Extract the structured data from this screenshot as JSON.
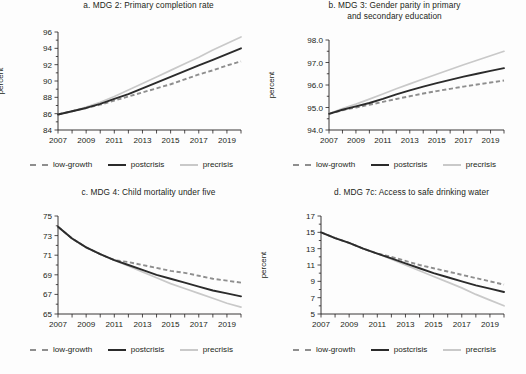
{
  "figure": {
    "background": "#fdfdfd",
    "colors": {
      "precrisis": "#c9c9c9",
      "postcrisis": "#2b2b2b",
      "low_growth": "#8e8e8e",
      "axis": "#231f20"
    },
    "legend": {
      "low_growth_label": "low-growth",
      "postcrisis_label": "postcrisis",
      "precrisis_label": "precrisis"
    }
  },
  "chart_data": [
    {
      "id": "a",
      "type": "line",
      "title": "a.  MDG 2: Primary completion rate",
      "title_line1": "a.  MDG 2: Primary completion rate",
      "title_line2": "",
      "xlabel": "",
      "ylabel": "percent",
      "ylim": [
        84,
        96
      ],
      "yticks": [
        84,
        86,
        88,
        90,
        92,
        94,
        96
      ],
      "ytick_labels": [
        "84",
        "86",
        "88",
        "90",
        "92",
        "94",
        "96"
      ],
      "xlim": [
        2007,
        2020
      ],
      "xticks": [
        2007,
        2008,
        2009,
        2010,
        2011,
        2012,
        2013,
        2014,
        2015,
        2016,
        2017,
        2018,
        2019,
        2020
      ],
      "xtick_labels": [
        "2007",
        "2009",
        "2011",
        "2013",
        "2015",
        "2017",
        "2019"
      ],
      "xtick_labeled_years": [
        2007,
        2009,
        2011,
        2013,
        2015,
        2017,
        2019
      ],
      "grid": false,
      "legend_position": "below",
      "x": [
        2007,
        2008,
        2009,
        2010,
        2011,
        2012,
        2013,
        2014,
        2015,
        2016,
        2017,
        2018,
        2019,
        2020
      ],
      "series": [
        {
          "name": "precrisis",
          "values": [
            85.9,
            86.3,
            86.8,
            87.4,
            88.1,
            88.9,
            89.7,
            90.5,
            91.3,
            92.1,
            92.9,
            93.8,
            94.6,
            95.4
          ]
        },
        {
          "name": "postcrisis",
          "values": [
            85.9,
            86.3,
            86.7,
            87.2,
            87.8,
            88.4,
            89.1,
            89.8,
            90.5,
            91.2,
            91.9,
            92.6,
            93.3,
            94.0
          ]
        },
        {
          "name": "low-growth",
          "values": [
            85.9,
            86.3,
            86.7,
            87.1,
            87.6,
            88.1,
            88.6,
            89.1,
            89.6,
            90.2,
            90.8,
            91.3,
            91.9,
            92.4
          ]
        }
      ]
    },
    {
      "id": "b",
      "type": "line",
      "title": "b.  MDG 3: Gender parity in primary and secondary education",
      "title_line1": "b.  MDG 3: Gender parity in primary",
      "title_line2": "and secondary education",
      "xlabel": "",
      "ylabel": "percent",
      "ylim": [
        94.0,
        98.0
      ],
      "yticks": [
        94.0,
        95.0,
        96.0,
        97.0,
        98.0
      ],
      "ytick_labels": [
        "94.0",
        "95.0",
        "96.0",
        "97.0",
        "98.0"
      ],
      "xlim": [
        2007,
        2020
      ],
      "xticks": [
        2007,
        2008,
        2009,
        2010,
        2011,
        2012,
        2013,
        2014,
        2015,
        2016,
        2017,
        2018,
        2019,
        2020
      ],
      "xtick_labels": [
        "2007",
        "2009",
        "2011",
        "2013",
        "2015",
        "2017",
        "2019"
      ],
      "xtick_labeled_years": [
        2007,
        2009,
        2011,
        2013,
        2015,
        2017,
        2019
      ],
      "grid": false,
      "legend_position": "below",
      "x": [
        2007,
        2008,
        2009,
        2010,
        2011,
        2012,
        2013,
        2014,
        2015,
        2016,
        2017,
        2018,
        2019,
        2020
      ],
      "series": [
        {
          "name": "precrisis",
          "values": [
            94.72,
            94.95,
            95.15,
            95.37,
            95.6,
            95.83,
            96.05,
            96.27,
            96.48,
            96.69,
            96.9,
            97.1,
            97.3,
            97.5
          ]
        },
        {
          "name": "postcrisis",
          "values": [
            94.72,
            94.9,
            95.05,
            95.2,
            95.38,
            95.58,
            95.76,
            95.93,
            96.08,
            96.23,
            96.37,
            96.5,
            96.63,
            96.75
          ]
        },
        {
          "name": "low-growth",
          "values": [
            94.72,
            94.88,
            95.0,
            95.12,
            95.25,
            95.38,
            95.5,
            95.62,
            95.73,
            95.83,
            95.93,
            96.02,
            96.11,
            96.2
          ]
        }
      ]
    },
    {
      "id": "c",
      "type": "line",
      "title": "c.  MDG 4: Child mortality under five",
      "title_line1": "c.  MDG 4: Child mortality under five",
      "title_line2": "",
      "xlabel": "",
      "ylabel": "deaths per 1,000",
      "ylim": [
        65,
        75
      ],
      "yticks": [
        65,
        67,
        69,
        71,
        73,
        75
      ],
      "ytick_labels": [
        "65",
        "67",
        "69",
        "71",
        "73",
        "75"
      ],
      "xlim": [
        2007,
        2020
      ],
      "xticks": [
        2007,
        2008,
        2009,
        2010,
        2011,
        2012,
        2013,
        2014,
        2015,
        2016,
        2017,
        2018,
        2019,
        2020
      ],
      "xtick_labels": [
        "2007",
        "2009",
        "2011",
        "2013",
        "2015",
        "2017",
        "2019"
      ],
      "xtick_labeled_years": [
        2007,
        2009,
        2011,
        2013,
        2015,
        2017,
        2019
      ],
      "grid": false,
      "legend_position": "below",
      "x": [
        2007,
        2008,
        2009,
        2010,
        2011,
        2012,
        2013,
        2014,
        2015,
        2016,
        2017,
        2018,
        2019,
        2020
      ],
      "series": [
        {
          "name": "precrisis",
          "values": [
            73.9,
            72.7,
            71.8,
            71.1,
            70.5,
            69.9,
            69.3,
            68.7,
            68.1,
            67.6,
            67.1,
            66.6,
            66.1,
            65.7
          ]
        },
        {
          "name": "postcrisis",
          "values": [
            73.9,
            72.7,
            71.8,
            71.1,
            70.5,
            70.0,
            69.5,
            69.0,
            68.6,
            68.2,
            67.8,
            67.4,
            67.1,
            66.8
          ]
        },
        {
          "name": "low-growth",
          "values": [
            73.9,
            72.7,
            71.8,
            71.1,
            70.5,
            70.3,
            70.0,
            69.7,
            69.4,
            69.2,
            68.9,
            68.6,
            68.4,
            68.2
          ]
        }
      ]
    },
    {
      "id": "d",
      "type": "line",
      "title": "d.  MDG 7c: Access to safe drinking water",
      "title_line1": "d.  MDG 7c: Access to safe drinking water",
      "title_line2": "",
      "xlabel": "",
      "ylabel": "percent",
      "ylim": [
        5,
        17
      ],
      "yticks": [
        5,
        7,
        9,
        11,
        13,
        15,
        17
      ],
      "ytick_labels": [
        "5",
        "7",
        "9",
        "11",
        "13",
        "15",
        "17"
      ],
      "xlim": [
        2007,
        2020
      ],
      "xticks": [
        2007,
        2008,
        2009,
        2010,
        2011,
        2012,
        2013,
        2014,
        2015,
        2016,
        2017,
        2018,
        2019,
        2020
      ],
      "xtick_labels": [
        "2007",
        "2009",
        "2011",
        "2013",
        "2015",
        "2017",
        "2019"
      ],
      "xtick_labeled_years": [
        2007,
        2009,
        2011,
        2013,
        2015,
        2017,
        2019
      ],
      "grid": false,
      "legend_position": "below",
      "x": [
        2007,
        2008,
        2009,
        2010,
        2011,
        2012,
        2013,
        2014,
        2015,
        2016,
        2017,
        2018,
        2019,
        2020
      ],
      "series": [
        {
          "name": "precrisis",
          "values": [
            15.0,
            14.3,
            13.7,
            13.0,
            12.4,
            11.7,
            11.0,
            10.3,
            9.6,
            8.9,
            8.2,
            7.4,
            6.7,
            6.0
          ]
        },
        {
          "name": "postcrisis",
          "values": [
            15.0,
            14.3,
            13.7,
            13.0,
            12.4,
            11.8,
            11.2,
            10.6,
            10.0,
            9.5,
            9.0,
            8.5,
            8.1,
            7.7
          ]
        },
        {
          "name": "low-growth",
          "values": [
            15.0,
            14.3,
            13.7,
            13.0,
            12.4,
            12.0,
            11.5,
            11.0,
            10.6,
            10.2,
            9.8,
            9.4,
            9.0,
            8.6
          ]
        }
      ]
    }
  ]
}
